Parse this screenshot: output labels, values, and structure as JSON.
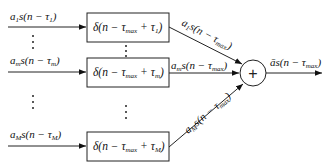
{
  "diagram": {
    "type": "block-diagram",
    "inputs": [
      {
        "id": "in1",
        "coef": "a",
        "coef_sub": "1",
        "delay_sub": "1",
        "label": "a1 s(n − τ1)"
      },
      {
        "id": "inm",
        "coef": "a",
        "coef_sub": "m",
        "delay_sub": "m",
        "label": "am s(n − τm)"
      },
      {
        "id": "inM",
        "coef": "a",
        "coef_sub": "M",
        "delay_sub": "M",
        "label": "aM s(n − τM)"
      }
    ],
    "blocks": [
      {
        "id": "d1",
        "label": "δ(n − τmax + τ1)",
        "sub": "1"
      },
      {
        "id": "dm",
        "label": "δ(n − τmax + τm)",
        "sub": "m"
      },
      {
        "id": "dM",
        "label": "δ(n − τmax + τM)",
        "sub": "M"
      }
    ],
    "block_outputs": [
      {
        "from": "d1",
        "label": "a1 s(n − τmax)",
        "coef_sub": "1"
      },
      {
        "from": "dm",
        "label": "am s(n − τmax)",
        "coef_sub": "m"
      },
      {
        "from": "dM",
        "label": "aM s(n − τmax)",
        "coef_sub": "M"
      }
    ],
    "summer": {
      "symbol": "+"
    },
    "output": {
      "label": "ā s(n − τmax)"
    },
    "ellipsis": "⋮",
    "text": {
      "s_open": "s(n − τ",
      "close": ")",
      "delta_open": "δ(n − τ",
      "max": "max",
      "plus_tau": " + τ",
      "abar": "ā",
      "minus": " − τ"
    }
  }
}
